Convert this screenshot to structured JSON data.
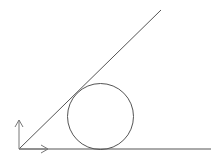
{
  "diagram": {
    "width": 221,
    "height": 160,
    "background": "#ffffff",
    "stroke_color": "#555555",
    "axis_color": "#777777",
    "origin": {
      "x": 19,
      "y": 149
    },
    "ground_line": {
      "x1": 19,
      "y1": 149,
      "x2": 211,
      "y2": 149
    },
    "incline_line": {
      "x1": 19,
      "y1": 149,
      "x2": 161,
      "y2": 10
    },
    "circle": {
      "cx": 100.5,
      "cy": 116.5,
      "r": 33
    },
    "x_axis_arrow": {
      "x1": 19,
      "y1": 149,
      "x2": 48,
      "y2": 149
    },
    "y_axis_arrow": {
      "x1": 19,
      "y1": 149,
      "x2": 19,
      "y2": 120
    }
  }
}
